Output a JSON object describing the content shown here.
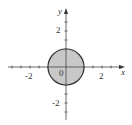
{
  "chart_data": {
    "type": "scatter",
    "title": "",
    "xlabel": "x",
    "ylabel": "y",
    "origin_label": "0",
    "xlim": [
      -3.4,
      3.3
    ],
    "ylim": [
      -2.8,
      3.2
    ],
    "x_tick_step": 0.5,
    "y_tick_step": 0.5,
    "x_tick_labels": [
      {
        "value": -2,
        "text": "-2"
      },
      {
        "value": 2,
        "text": "2"
      }
    ],
    "y_tick_labels": [
      {
        "value": 2,
        "text": "2"
      },
      {
        "value": -2,
        "text": "-2"
      }
    ],
    "grid": false,
    "legend": null,
    "shapes": [
      {
        "type": "disk",
        "center": [
          0,
          0
        ],
        "radius": 1,
        "fill": "#c8c8c8",
        "stroke": "#333333",
        "description": "filled unit disk x^2 + y^2 <= 1"
      }
    ]
  },
  "colors": {
    "axis": "#444444",
    "fill": "#c8c8c8",
    "outline": "#333333"
  }
}
